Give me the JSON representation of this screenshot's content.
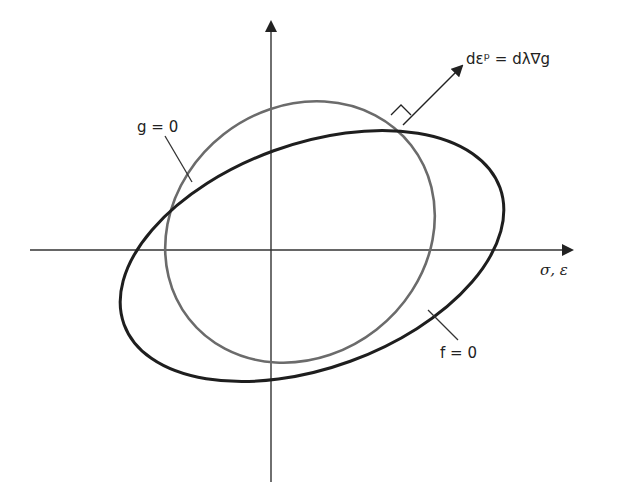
{
  "diagram": {
    "type": "yield-surface-plastic-potential",
    "axes": {
      "horizontal_label": "σ, ε",
      "vertical_label": ""
    },
    "curves": [
      {
        "name": "plastic-potential",
        "label": "g = 0",
        "color": "#6b6b6b"
      },
      {
        "name": "yield-surface",
        "label": "f = 0",
        "color": "#1e1e1e"
      }
    ],
    "flow_vector": {
      "label": "dεᵖ = dλ∇g",
      "normal_marker": "right-angle"
    },
    "colors": {
      "axis": "#333333",
      "background": "#ffffff"
    }
  }
}
